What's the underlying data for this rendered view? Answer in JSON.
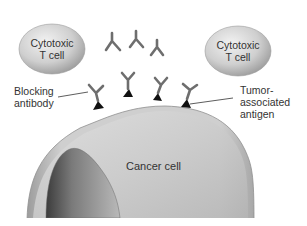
{
  "diagram": {
    "t_cells": [
      {
        "label_line1": "Cytotoxic",
        "label_line2": "T cell"
      },
      {
        "label_line1": "Cytotoxic",
        "label_line2": "T cell"
      }
    ],
    "labels": {
      "blocking_antibody_line1": "Blocking",
      "blocking_antibody_line2": "antibody",
      "tumor_antigen_line1": "Tumor-",
      "tumor_antigen_line2": "associated",
      "tumor_antigen_line3": "antigen",
      "cancer_cell": "Cancer cell"
    },
    "colors": {
      "cell_fill": "#c9c9c9",
      "nucleus_fill": "#8a8a8a",
      "antibody": "#6e6e6e",
      "antigen": "#111111",
      "text": "#333333"
    }
  }
}
